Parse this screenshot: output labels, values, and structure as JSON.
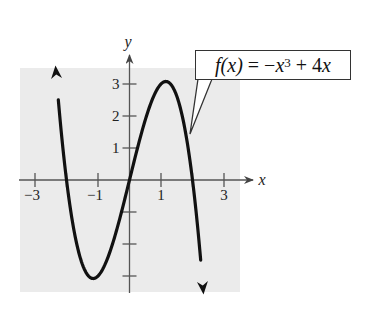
{
  "chart_data": {
    "type": "line",
    "title": "",
    "function_label": "f(x) = -x^3 + 4x",
    "function_label_parts": {
      "lhs": "f(x)",
      "eq": " = −",
      "var": "x",
      "exp": "3",
      "rest": " + 4",
      "var2": "x"
    },
    "xlabel": "x",
    "ylabel": "y",
    "xlim": [
      -3.5,
      3.8
    ],
    "ylim": [
      -3.5,
      3.9
    ],
    "x_ticks": [
      -3,
      -2,
      -1,
      1,
      2,
      3
    ],
    "x_tick_labels": {
      "-3": "−3",
      "-1": "−1",
      "1": "1",
      "3": "3"
    },
    "y_ticks": [
      -3,
      -2,
      -1,
      1,
      2,
      3
    ],
    "y_tick_labels": {
      "1": "1",
      "2": "2",
      "3": "3"
    },
    "grid": false,
    "background": "#ebebeb",
    "line_color": "#111111",
    "series": [
      {
        "name": "f(x) = -x^3 + 4x",
        "x": [
          -2.35,
          -2.25,
          -2.0,
          -1.75,
          -1.5,
          -1.25,
          -1.15,
          -1.0,
          -0.75,
          -0.5,
          -0.25,
          0,
          0.25,
          0.5,
          0.75,
          1.0,
          1.15,
          1.25,
          1.5,
          1.75,
          2.0,
          2.25,
          2.35
        ],
        "y": [
          3.58,
          2.39,
          0.0,
          -1.64,
          -2.63,
          -3.05,
          -3.08,
          -3.0,
          -2.58,
          -1.88,
          -0.98,
          0.0,
          0.98,
          1.88,
          2.58,
          3.0,
          3.08,
          3.05,
          2.63,
          1.64,
          0.0,
          -2.39,
          -3.58
        ],
        "arrows": "both ends"
      }
    ],
    "key_points": {
      "zeros": [
        -2,
        0,
        2
      ],
      "local_max": [
        1.15,
        3.08
      ],
      "local_min": [
        -1.15,
        -3.08
      ]
    }
  }
}
